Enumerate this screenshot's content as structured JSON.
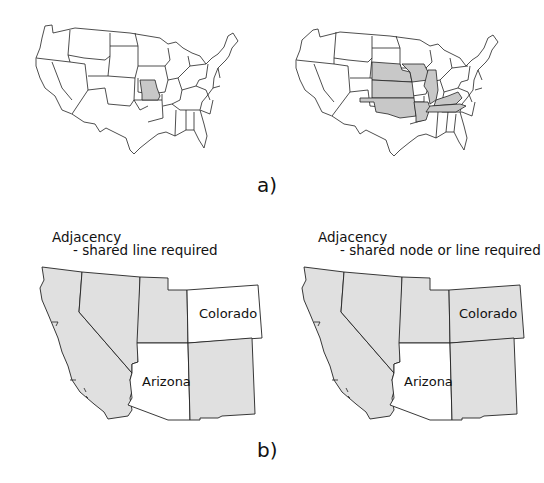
{
  "figure": {
    "panel_a": {
      "label": "a)",
      "maps": [
        {
          "name": "us-map-single-state",
          "highlighted_states": [
            "Missouri"
          ]
        },
        {
          "name": "us-map-neighbor-states",
          "highlighted_states": [
            "Nebraska",
            "Iowa",
            "Illinois",
            "Kansas",
            "Kentucky",
            "Oklahoma",
            "Arkansas",
            "Tennessee"
          ]
        }
      ]
    },
    "panel_b": {
      "label": "b)",
      "maps": [
        {
          "title": "Adjacency",
          "subtitle": "- shared line required",
          "state_labels": {
            "colorado": "Colorado",
            "arizona": "Arizona"
          },
          "highlighted_states": [
            "California",
            "Nevada",
            "Utah",
            "New Mexico"
          ]
        },
        {
          "title": "Adjacency",
          "subtitle": "- shared node or line required",
          "state_labels": {
            "colorado": "Colorado",
            "arizona": "Arizona"
          },
          "highlighted_states": [
            "California",
            "Nevada",
            "Utah",
            "Colorado",
            "New Mexico"
          ]
        }
      ]
    },
    "colors": {
      "highlight": "#c8c8c8",
      "highlight_b": "#e0e0e0",
      "stroke": "#222222",
      "background": "#ffffff"
    }
  }
}
